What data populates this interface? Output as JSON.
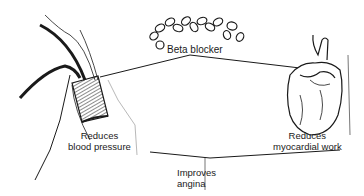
{
  "diagram": {
    "center_label": "Beta blocker",
    "effects": [
      {
        "id": "blood-pressure",
        "line1": "Reduces",
        "line2": "blood pressure"
      },
      {
        "id": "myocardial-work",
        "line1": "Reduces",
        "line2": "myocardial work"
      }
    ],
    "outcome": {
      "line1": "Improves",
      "line2": "angina"
    },
    "illustrations": [
      "pills-icon",
      "blood-vessel-icon",
      "heart-icon"
    ],
    "colors": {
      "ink": "#1a1a1a",
      "background": "#ffffff"
    }
  }
}
